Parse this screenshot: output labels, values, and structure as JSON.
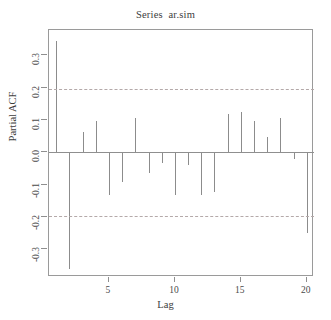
{
  "chart_data": {
    "type": "bar",
    "title": "Series  ar.sim",
    "xlabel": "Lag",
    "ylabel": "Partial ACF",
    "x": [
      1,
      2,
      3,
      4,
      5,
      6,
      7,
      8,
      9,
      10,
      11,
      12,
      13,
      14,
      15,
      16,
      17,
      18,
      19,
      20
    ],
    "values": [
      0.345,
      -0.36,
      0.063,
      0.098,
      -0.131,
      -0.093,
      0.106,
      -0.063,
      -0.032,
      -0.133,
      -0.04,
      -0.133,
      -0.122,
      0.12,
      0.124,
      0.098,
      0.047,
      0.105,
      -0.022,
      -0.25
    ],
    "xticks": [
      5,
      10,
      15,
      20
    ],
    "xticklabels": [
      "5",
      "10",
      "15",
      "20"
    ],
    "yticks": [
      0.3,
      0.2,
      0.1,
      0.0,
      -0.1,
      -0.2,
      -0.3
    ],
    "yticklabels": [
      "0.3",
      "0.2",
      "0.1",
      "0.0",
      "-0.1",
      "-0.2",
      "-0.3"
    ],
    "xlim": [
      0.45,
      20.55
    ],
    "ylim": [
      -0.385,
      0.378
    ],
    "grid": false,
    "legend": null,
    "confidence_bounds": [
      0.196,
      -0.196
    ],
    "confidence_style": "dashed",
    "zero_reference": 0.0,
    "series_color": "#8c8c8c",
    "confidence_color": "#b4a9a9",
    "axis_color": "#8f8f8f"
  }
}
